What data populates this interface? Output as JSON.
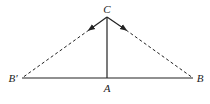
{
  "diagram": {
    "type": "geometry",
    "points": {
      "C": {
        "label": "C",
        "x": 107,
        "y": 17
      },
      "A": {
        "label": "A",
        "x": 107,
        "y": 78
      },
      "B": {
        "label": "B",
        "x": 193,
        "y": 78
      },
      "B_prime": {
        "label": "B′",
        "x": 22,
        "y": 78
      }
    },
    "segments": [
      {
        "from": "B_prime",
        "to": "B",
        "style": "solid"
      },
      {
        "from": "C",
        "to": "A",
        "style": "solid"
      },
      {
        "from": "C",
        "to": "B_prime",
        "style": "solid-then-dashed",
        "arrow": "toward B′"
      },
      {
        "from": "C",
        "to": "B",
        "style": "solid-then-dashed",
        "arrow": "toward B"
      }
    ],
    "colors": {
      "line": "#222222",
      "background": "#ffffff"
    }
  }
}
